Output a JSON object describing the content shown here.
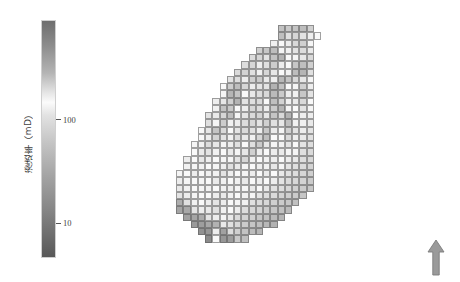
{
  "figure": {
    "background_color": "#ffffff",
    "width": 460,
    "height": 282
  },
  "colorbar": {
    "name": "permeability-colorbar",
    "axis_label": "渗透率（mD）",
    "scale": "log",
    "orientation": "vertical",
    "ticks": [
      {
        "label": "100",
        "value": 100,
        "position_fraction": 0.42
      },
      {
        "label": "10",
        "value": 10,
        "position_fraction": 0.855
      }
    ],
    "gradient_stops": [
      {
        "offset": 0.0,
        "color": "#6e6e6e"
      },
      {
        "offset": 0.1,
        "color": "#8b8b8b"
      },
      {
        "offset": 0.22,
        "color": "#b4b4b4"
      },
      {
        "offset": 0.3,
        "color": "#e3e3e3"
      },
      {
        "offset": 0.345,
        "color": "#fbfbfb"
      },
      {
        "offset": 0.4,
        "color": "#e2e2e2"
      },
      {
        "offset": 0.52,
        "color": "#c3c3c3"
      },
      {
        "offset": 0.66,
        "color": "#a3a3a3"
      },
      {
        "offset": 0.8,
        "color": "#868686"
      },
      {
        "offset": 0.9,
        "color": "#6f6f6f"
      },
      {
        "offset": 1.0,
        "color": "#585858"
      }
    ]
  },
  "north_arrow": {
    "name": "north-arrow",
    "direction": "up",
    "fill_color": "#9a9a9a",
    "stroke_color": "#7a7a7a"
  },
  "chart_data": {
    "type": "heatmap",
    "title": "",
    "xlabel": "",
    "ylabel": "",
    "colorbar_label": "渗透率（mD）",
    "colorbar_scale": "log",
    "units": "mD",
    "value_range": [
      5,
      400
    ],
    "grid": {
      "rows": 31,
      "cols": 20,
      "cell_px": 7.25
    },
    "grid_on": true,
    "legend_position": "left",
    "annotations": [
      "north-arrow"
    ],
    "null_color": "#ffffff",
    "values": [
      [
        null,
        null,
        null,
        null,
        null,
        null,
        null,
        null,
        null,
        null,
        null,
        null,
        null,
        null,
        200,
        185,
        195,
        210,
        175,
        null
      ],
      [
        null,
        null,
        null,
        null,
        null,
        null,
        null,
        null,
        null,
        null,
        null,
        null,
        null,
        null,
        205,
        150,
        165,
        145,
        130,
        115
      ],
      [
        null,
        null,
        null,
        null,
        null,
        null,
        null,
        null,
        null,
        null,
        null,
        null,
        null,
        125,
        110,
        95,
        160,
        175,
        120,
        null
      ],
      [
        null,
        null,
        null,
        null,
        null,
        null,
        null,
        null,
        null,
        null,
        null,
        175,
        190,
        210,
        120,
        100,
        145,
        155,
        135,
        null
      ],
      [
        null,
        null,
        null,
        null,
        null,
        null,
        null,
        null,
        null,
        null,
        155,
        165,
        145,
        200,
        230,
        115,
        105,
        140,
        160,
        null
      ],
      [
        null,
        null,
        null,
        null,
        null,
        null,
        null,
        null,
        null,
        75,
        65,
        130,
        150,
        180,
        95,
        110,
        190,
        205,
        175,
        null
      ],
      [
        null,
        null,
        null,
        null,
        null,
        null,
        null,
        null,
        70,
        60,
        80,
        125,
        165,
        140,
        115,
        100,
        210,
        225,
        150,
        null
      ],
      [
        null,
        null,
        null,
        null,
        null,
        null,
        null,
        85,
        75,
        95,
        175,
        185,
        90,
        130,
        220,
        195,
        160,
        140,
        120,
        null
      ],
      [
        null,
        null,
        null,
        null,
        null,
        null,
        115,
        180,
        210,
        165,
        95,
        85,
        145,
        235,
        200,
        110,
        105,
        175,
        130,
        null
      ],
      [
        null,
        null,
        null,
        null,
        null,
        null,
        120,
        225,
        195,
        110,
        90,
        75,
        160,
        215,
        185,
        95,
        125,
        190,
        145,
        null
      ],
      [
        null,
        null,
        null,
        null,
        null,
        130,
        140,
        175,
        230,
        145,
        80,
        70,
        115,
        205,
        170,
        100,
        135,
        160,
        115,
        null
      ],
      [
        null,
        null,
        null,
        null,
        null,
        125,
        200,
        190,
        115,
        95,
        65,
        75,
        130,
        185,
        225,
        120,
        110,
        145,
        105,
        null
      ],
      [
        null,
        null,
        null,
        null,
        145,
        135,
        165,
        210,
        105,
        85,
        70,
        60,
        140,
        195,
        160,
        230,
        115,
        130,
        95,
        null
      ],
      [
        null,
        null,
        null,
        null,
        150,
        120,
        180,
        125,
        95,
        75,
        65,
        85,
        175,
        150,
        140,
        205,
        125,
        100,
        90,
        null
      ],
      [
        null,
        null,
        null,
        110,
        140,
        195,
        160,
        115,
        85,
        70,
        80,
        130,
        190,
        135,
        120,
        175,
        145,
        95,
        85,
        null
      ],
      [
        null,
        null,
        null,
        115,
        130,
        170,
        145,
        100,
        75,
        90,
        125,
        165,
        210,
        115,
        110,
        160,
        130,
        90,
        80,
        null
      ],
      [
        null,
        null,
        105,
        125,
        155,
        140,
        120,
        95,
        80,
        110,
        150,
        185,
        140,
        105,
        125,
        145,
        115,
        85,
        75,
        null
      ],
      [
        null,
        null,
        110,
        135,
        145,
        125,
        110,
        90,
        105,
        140,
        175,
        130,
        115,
        95,
        135,
        120,
        105,
        80,
        70,
        null
      ],
      [
        null,
        95,
        115,
        140,
        130,
        115,
        105,
        120,
        145,
        165,
        125,
        110,
        100,
        130,
        115,
        95,
        90,
        75,
        65,
        null
      ],
      [
        null,
        100,
        120,
        125,
        115,
        105,
        130,
        150,
        135,
        120,
        110,
        95,
        125,
        140,
        105,
        85,
        80,
        70,
        60,
        null
      ],
      [
        105,
        110,
        130,
        115,
        100,
        125,
        145,
        130,
        115,
        105,
        95,
        115,
        135,
        110,
        90,
        80,
        75,
        65,
        55,
        null
      ],
      [
        95,
        105,
        115,
        120,
        110,
        135,
        125,
        110,
        100,
        90,
        110,
        130,
        115,
        95,
        85,
        70,
        65,
        60,
        50,
        null
      ],
      [
        90,
        100,
        110,
        105,
        125,
        115,
        100,
        95,
        105,
        120,
        135,
        110,
        90,
        80,
        75,
        65,
        55,
        50,
        45,
        null
      ],
      [
        85,
        95,
        105,
        115,
        110,
        95,
        90,
        100,
        115,
        125,
        105,
        85,
        75,
        70,
        60,
        55,
        50,
        45,
        null,
        null
      ],
      [
        25,
        80,
        100,
        110,
        95,
        85,
        95,
        110,
        120,
        100,
        80,
        70,
        65,
        55,
        50,
        45,
        40,
        null,
        null,
        null
      ],
      [
        20,
        22,
        85,
        95,
        90,
        80,
        100,
        115,
        95,
        75,
        65,
        60,
        50,
        45,
        40,
        35,
        null,
        null,
        null,
        null
      ],
      [
        null,
        18,
        20,
        24,
        85,
        95,
        105,
        90,
        70,
        60,
        55,
        45,
        40,
        35,
        30,
        null,
        null,
        null,
        null,
        null
      ],
      [
        null,
        null,
        15,
        17,
        22,
        28,
        90,
        80,
        65,
        50,
        45,
        38,
        32,
        28,
        null,
        null,
        null,
        null,
        null,
        null
      ],
      [
        null,
        null,
        null,
        12,
        14,
        95,
        18,
        75,
        55,
        42,
        36,
        30,
        null,
        null,
        null,
        null,
        null,
        null,
        null,
        null
      ],
      [
        null,
        null,
        null,
        null,
        10,
        115,
        14,
        16,
        48,
        38,
        null,
        null,
        null,
        null,
        null,
        null,
        null,
        null,
        null,
        null
      ],
      [
        null,
        null,
        null,
        null,
        null,
        null,
        null,
        null,
        null,
        null,
        null,
        null,
        null,
        null,
        null,
        null,
        null,
        null,
        null,
        null
      ]
    ]
  }
}
